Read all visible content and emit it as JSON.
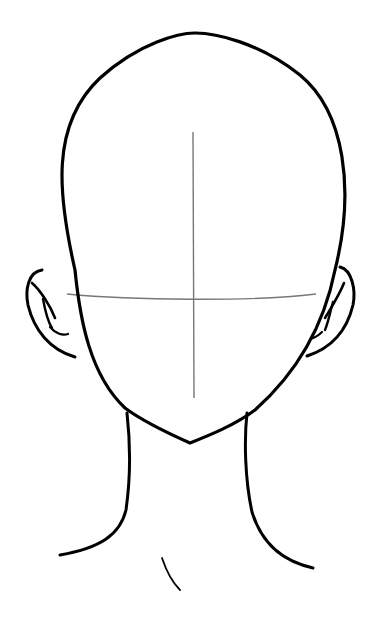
{
  "image": {
    "subject": "head drawing template",
    "width": 375,
    "height": 628,
    "background": "#ffffff",
    "stroke_color": "#000000",
    "guide_color": "#777777"
  },
  "shapes": {
    "head_outline": "M75,270 C58,195 50,125 100,78 C140,42 180,33 195,33 C215,33 258,42 300,75 C345,112 355,190 335,270 C325,320 300,370 255,410 C235,425 210,435 190,443 C172,435 145,423 125,408 C90,375 80,320 75,270 Z",
    "vertical_guide": "M193,132 L194,398",
    "horizontal_guide": "M67,294 C130,300 250,302 316,294",
    "left_ear_outer": "M42,270 C28,272 25,290 28,305 C34,330 50,350 75,357",
    "left_ear_inner1": "M32,283 C40,290 50,305 55,318",
    "left_ear_inner2": "M43,299 C45,310 48,322 52,328",
    "left_ear_inner3": "M50,327 C55,333 62,336 68,334",
    "right_ear_outer": "M340,267 C352,270 356,290 353,305 C347,330 332,348 307,356",
    "right_ear_inner1": "M344,283 C340,293 333,305 325,318",
    "right_ear_inner2": "M333,302 C330,312 329,320 325,330",
    "right_ear_inner3": "M322,332 C318,336 314,338 310,339",
    "neck_left": "M127,413 C130,440 131,475 126,510 C120,535 100,548 60,555",
    "neck_right": "M247,413 C244,440 245,480 252,512 C262,545 285,562 313,568",
    "collarbone_mark": "M162,558 C166,570 172,582 180,590"
  }
}
